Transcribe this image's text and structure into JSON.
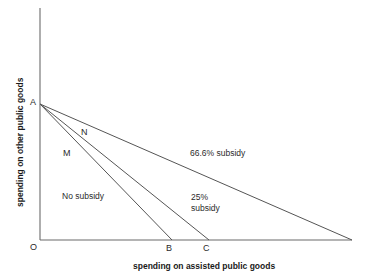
{
  "figure": {
    "width": 370,
    "height": 280,
    "background": "#ffffff",
    "line_color": "#555555",
    "axis_color": "#6b6b6b",
    "text_color": "#2b2b2b"
  },
  "axes": {
    "x_title": "spending on assisted public goods",
    "y_title": "spending on other public goods",
    "x_axis": {
      "x0": 40,
      "x1": 352,
      "y": 240
    },
    "y_axis": {
      "x": 40,
      "y0": 8,
      "y1": 240
    }
  },
  "points": [
    {
      "name": "O",
      "label": "O",
      "x": 31,
      "y": 248
    },
    {
      "name": "A",
      "label": "A",
      "x": 31,
      "y": 103
    },
    {
      "name": "M",
      "label": "M",
      "x": 64,
      "y": 155
    },
    {
      "name": "N",
      "label": "N",
      "x": 81,
      "y": 134
    },
    {
      "name": "B",
      "label": "B",
      "x": 168,
      "y": 250
    },
    {
      "name": "C",
      "label": "C",
      "x": 205,
      "y": 250
    }
  ],
  "budget_lines": [
    {
      "name": "no-subsidy-line",
      "x1": 40,
      "y1": 104,
      "x2": 172,
      "y2": 240
    },
    {
      "name": "25-subsidy-line",
      "x1": 40,
      "y1": 104,
      "x2": 209,
      "y2": 240
    },
    {
      "name": "66-subsidy-line",
      "x1": 40,
      "y1": 104,
      "x2": 352,
      "y2": 240
    }
  ],
  "annotations": [
    {
      "name": "no-subsidy-label",
      "text": "No subsidy",
      "x": 62,
      "y": 195
    },
    {
      "name": "subsidy-66-label",
      "text": "66.6% subsidy",
      "x": 190,
      "y": 151
    },
    {
      "name": "subsidy-25-label-1",
      "text": "25%",
      "x": 191,
      "y": 195
    },
    {
      "name": "subsidy-25-label-2",
      "text": "subsidy",
      "x": 191,
      "y": 206
    }
  ],
  "chart_data": {
    "type": "line",
    "title": "",
    "xlabel": "spending on assisted public goods",
    "ylabel": "spending on other public goods",
    "grid": false,
    "legend": "inline-annotations",
    "xlim": [
      0,
      1
    ],
    "ylim": [
      0,
      1
    ],
    "axis_ticks": {
      "x": [
        "O",
        "B",
        "C"
      ],
      "y": [
        "O",
        "A"
      ]
    },
    "series": [
      {
        "name": "No subsidy",
        "annotation": "No subsidy",
        "endpoint_label": "B",
        "x": [
          0,
          0.423
        ],
        "y": [
          1.0,
          0.0
        ]
      },
      {
        "name": "25% subsidy",
        "annotation": "25% subsidy",
        "endpoint_label": "C",
        "x": [
          0,
          0.542
        ],
        "y": [
          1.0,
          0.0
        ]
      },
      {
        "name": "66.6% subsidy",
        "annotation": "66.6% subsidy",
        "endpoint_label": "",
        "x": [
          0,
          1.0
        ],
        "y": [
          1.0,
          0.0
        ]
      }
    ],
    "indifference_points": [
      {
        "label": "A",
        "x": 0.0,
        "y": 1.0
      },
      {
        "label": "M",
        "x": 0.085,
        "y": 0.625
      },
      {
        "label": "N",
        "x": 0.145,
        "y": 0.77
      },
      {
        "label": "B",
        "x": 0.423,
        "y": 0.0
      },
      {
        "label": "C",
        "x": 0.542,
        "y": 0.0
      },
      {
        "label": "O",
        "x": 0.0,
        "y": 0.0
      }
    ]
  }
}
